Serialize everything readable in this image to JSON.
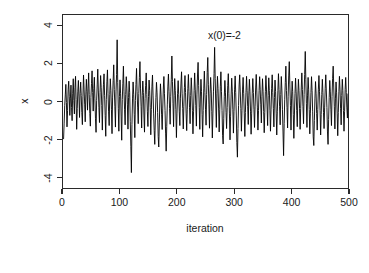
{
  "figure": {
    "background_color": "#ffffff",
    "foreground_color": "#1a1a1a",
    "line_color": "#000000"
  },
  "annotation": {
    "text": "x(0)=-2"
  },
  "chart_data": {
    "type": "line",
    "title": "",
    "subtitle": "",
    "xlabel": "iteration",
    "ylabel": "x",
    "xlim": [
      0,
      500
    ],
    "ylim": [
      -4.6,
      4.6
    ],
    "xticks": [
      0,
      100,
      200,
      300,
      400,
      500
    ],
    "xticklabels": [
      "0",
      "100",
      "200",
      "300",
      "400",
      "500"
    ],
    "yticks": [
      -4,
      -2,
      0,
      2,
      4
    ],
    "yticklabels": [
      "-4",
      "-2",
      "0",
      "2",
      "4"
    ],
    "grid": false,
    "legend": null,
    "annotations": [
      {
        "text": "x(0)=-2",
        "x": 265,
        "y": 3.9
      }
    ],
    "series": [
      {
        "name": "x",
        "color": "#000000",
        "linewidth": 1,
        "x_start": 1,
        "x_step": 1,
        "n_points": 500,
        "summary": {
          "mean": -0.04,
          "sd": 1.02,
          "min": -3.8,
          "max": 3.3,
          "initial_value": -2
        },
        "values": [
          -2.0,
          -1.15,
          -0.22,
          0.35,
          0.91,
          -0.05,
          -1.35,
          -0.48,
          0.62,
          1.08,
          0.25,
          -0.74,
          0.18,
          0.87,
          -0.32,
          -1.02,
          0.44,
          1.21,
          0.05,
          -0.66,
          0.73,
          1.34,
          0.11,
          -1.48,
          -0.38,
          0.55,
          1.12,
          0.24,
          -0.85,
          0.42,
          1.03,
          0.31,
          -0.59,
          -1.23,
          0.28,
          1.41,
          0.66,
          -0.14,
          -1.08,
          0.35,
          1.18,
          0.52,
          -0.46,
          0.71,
          1.52,
          0.38,
          -0.63,
          -1.31,
          0.22,
          0.95,
          1.63,
          0.48,
          -0.51,
          0.68,
          1.29,
          0.14,
          -0.92,
          -1.64,
          0.05,
          0.88,
          1.72,
          0.61,
          -0.33,
          -1.12,
          0.47,
          1.38,
          0.76,
          -0.21,
          -1.52,
          0.08,
          0.92,
          1.47,
          0.33,
          -0.74,
          -1.85,
          0.12,
          1.05,
          1.68,
          0.41,
          -0.55,
          -1.28,
          0.36,
          1.21,
          0.58,
          -0.44,
          -1.71,
          0.19,
          1.12,
          1.95,
          0.63,
          -0.28,
          -1.36,
          0.51,
          1.44,
          3.28,
          1.02,
          -0.38,
          -1.58,
          0.27,
          1.15,
          0.44,
          -0.82,
          -2.06,
          0.11,
          0.97,
          1.88,
          0.55,
          -0.41,
          -1.24,
          0.38,
          1.32,
          0.71,
          -0.18,
          -1.47,
          0.22,
          1.08,
          0.47,
          -1.05,
          -2.38,
          -3.78,
          -1.22,
          0.18,
          1.04,
          0.39,
          -0.68,
          -1.92,
          0.06,
          0.91,
          1.76,
          0.52,
          -0.34,
          -1.18,
          0.43,
          1.28,
          2.12,
          0.67,
          -0.25,
          -1.41,
          0.31,
          1.09,
          0.48,
          -0.77,
          -1.63,
          0.15,
          0.86,
          1.52,
          0.38,
          -0.52,
          -1.33,
          0.26,
          1.14,
          0.59,
          -0.31,
          -1.77,
          -0.42,
          0.78,
          1.41,
          0.34,
          -0.66,
          -1.55,
          -2.28,
          -0.88,
          0.22,
          1.02,
          0.46,
          -0.58,
          -1.86,
          -2.42,
          -1.14,
          0.08,
          0.94,
          0.35,
          -0.71,
          -1.49,
          -0.35,
          0.66,
          1.33,
          0.41,
          -0.48,
          -1.68,
          -2.64,
          -1.32,
          -0.18,
          0.82,
          1.46,
          0.52,
          -0.38,
          -1.21,
          0.28,
          1.18,
          2.42,
          1.06,
          -0.12,
          -1.34,
          0.33,
          1.22,
          0.58,
          -0.44,
          -1.92,
          -0.62,
          0.41,
          1.11,
          0.36,
          -0.55,
          -1.28,
          0.18,
          0.98,
          1.58,
          0.44,
          -0.36,
          -1.46,
          -0.28,
          0.74,
          1.38,
          0.48,
          -0.62,
          -1.55,
          -0.41,
          0.68,
          1.44,
          0.52,
          -0.33,
          -1.18,
          0.31,
          1.26,
          0.61,
          -0.47,
          -1.72,
          -0.55,
          0.58,
          1.52,
          0.66,
          -0.22,
          -1.31,
          0.35,
          1.41,
          2.08,
          0.84,
          -0.31,
          -1.48,
          0.24,
          1.18,
          0.54,
          -0.68,
          -1.88,
          -0.48,
          0.71,
          1.62,
          0.48,
          -0.41,
          -1.26,
          0.38,
          1.55,
          2.34,
          0.92,
          -0.18,
          -1.42,
          0.44,
          1.28,
          0.62,
          -0.52,
          -1.94,
          -0.66,
          0.55,
          1.48,
          2.88,
          1.22,
          -0.08,
          -1.38,
          0.41,
          1.34,
          0.68,
          -0.35,
          -1.62,
          -0.44,
          0.78,
          1.58,
          0.52,
          -0.48,
          -1.82,
          -2.26,
          -0.92,
          0.28,
          1.12,
          0.46,
          -0.58,
          -1.44,
          -0.32,
          0.84,
          1.48,
          0.41,
          -0.66,
          -2.04,
          -0.78,
          0.35,
          1.24,
          0.55,
          -0.44,
          -1.68,
          -0.52,
          0.62,
          1.36,
          0.48,
          -0.72,
          -2.18,
          -2.96,
          -1.44,
          -0.22,
          0.88,
          1.42,
          0.51,
          -0.38,
          -1.58,
          -0.48,
          0.66,
          1.28,
          0.44,
          -0.62,
          -1.86,
          -0.58,
          0.48,
          1.34,
          0.58,
          -0.28,
          -1.22,
          0.34,
          1.18,
          0.52,
          -0.55,
          -1.74,
          -0.62,
          0.44,
          1.22,
          0.48,
          -0.42,
          -1.38,
          -0.25,
          0.72,
          1.44,
          0.56,
          -0.34,
          -1.52,
          -0.48,
          0.58,
          1.32,
          0.62,
          -0.18,
          -1.14,
          0.28,
          1.21,
          0.55,
          -0.52,
          -1.66,
          -0.58,
          0.52,
          1.38,
          0.66,
          -0.24,
          -1.28,
          0.32,
          1.26,
          0.58,
          -0.46,
          -1.58,
          -0.44,
          0.68,
          1.42,
          0.48,
          -0.38,
          -1.35,
          0.22,
          1.14,
          0.52,
          -0.62,
          -1.78,
          -0.55,
          0.58,
          1.48,
          0.64,
          -0.28,
          -1.24,
          0.36,
          1.33,
          0.61,
          -0.44,
          -1.62,
          -2.88,
          -1.18,
          0.12,
          1.02,
          1.88,
          0.58,
          -0.32,
          -1.41,
          0.28,
          1.36,
          2.12,
          0.88,
          -0.22,
          -1.52,
          0.18,
          1.08,
          0.52,
          -0.68,
          -1.96,
          -0.72,
          0.42,
          1.24,
          0.55,
          -0.48,
          -1.34,
          0.24,
          1.18,
          0.58,
          -0.36,
          -1.48,
          -0.38,
          0.72,
          1.52,
          0.64,
          -0.26,
          -1.18,
          0.38,
          1.44,
          2.66,
          1.18,
          -0.12,
          -1.38,
          0.34,
          1.28,
          0.62,
          -0.42,
          -1.72,
          -0.62,
          0.48,
          1.32,
          0.58,
          -0.55,
          -1.88,
          -2.34,
          -1.02,
          0.18,
          1.06,
          0.44,
          -0.64,
          -1.52,
          -0.42,
          0.62,
          1.38,
          0.52,
          -0.48,
          -1.78,
          -0.68,
          0.38,
          1.18,
          0.48,
          -0.58,
          -1.44,
          -0.34,
          0.68,
          1.42,
          0.56,
          -0.32,
          -1.62,
          -2.28,
          -0.96,
          0.22,
          1.12,
          0.51,
          -0.44,
          -1.28,
          0.26,
          1.22,
          1.88,
          0.72,
          -0.28,
          -1.46,
          0.18,
          1.04,
          0.46,
          -0.62,
          -1.82,
          -0.58,
          0.52,
          1.34,
          0.62,
          -0.36,
          -1.24,
          0.32,
          1.18,
          0.58,
          -0.48,
          -1.58,
          -0.52,
          0.64,
          1.28,
          0.48,
          -0.34,
          -0.88,
          0.42
        ]
      }
    ]
  }
}
